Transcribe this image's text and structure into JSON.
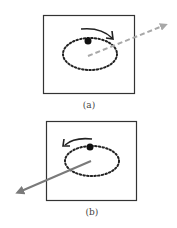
{
  "panels": [
    {
      "label": "(a)",
      "line_style": "dashed",
      "line_color": "#a8a8a8",
      "rotation": "clockwise"
    },
    {
      "label": "(b)",
      "line_style": "solid",
      "line_color": "#7a7a7a",
      "rotation": "counterclockwise"
    }
  ]
}
